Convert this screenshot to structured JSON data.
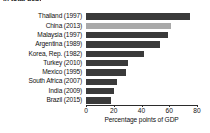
{
  "chart_data": {
    "type": "bar",
    "orientation": "horizontal",
    "title": "in total debt",
    "xlabel": "Percentage points of GDP",
    "ylabel": "",
    "xlim": [
      0,
      80
    ],
    "xticks": [
      0,
      20,
      40,
      60,
      80
    ],
    "grid": false,
    "legend": "none",
    "categories": [
      "Thailand (1997)",
      "China (2013)",
      "Malaysia (1997)",
      "Argentina (1989)",
      "Korea, Rep. (1982)",
      "Turkey (2010)",
      "Mexico (1995)",
      "South Africa (2007)",
      "India (2009)",
      "Brazil (2015)"
    ],
    "values": [
      75,
      61,
      59,
      53,
      42,
      30,
      29,
      22,
      20,
      18
    ],
    "highlight_index": 1,
    "colors": {
      "bar": "#3a3a3a",
      "bar_highlight": "#a9a9a9",
      "axis": "#2b2b2b",
      "text": "#111111",
      "background": "#ffffff"
    }
  }
}
